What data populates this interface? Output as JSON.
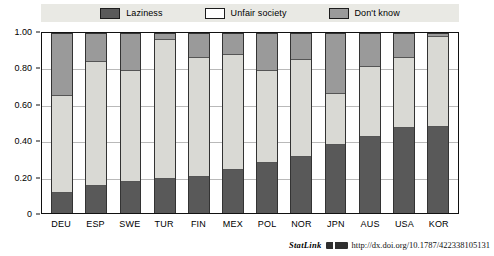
{
  "legend": {
    "items": [
      {
        "label": "Laziness",
        "color": "#595959",
        "icon": "legend-swatch-laziness"
      },
      {
        "label": "Unfair society",
        "color": "#ffffff",
        "icon": "legend-swatch-unfair-society"
      },
      {
        "label": "Don't know",
        "color": "#9a9a9a",
        "icon": "legend-swatch-dont-know"
      }
    ],
    "background": "#e9e9e4"
  },
  "axis": {
    "y_ticks": [
      "1.00",
      "0.80",
      "0.60",
      "0.40",
      "0.20",
      "0"
    ],
    "y_tick_values": [
      1.0,
      0.8,
      0.6,
      0.4,
      0.2,
      0
    ]
  },
  "footer": {
    "statlink_label": "StatLink",
    "url": "http://dx.doi.org/10.1787/422338105131",
    "glyph": "statlink-glyph-icon"
  },
  "chart_data": {
    "type": "bar",
    "subtype": "stacked-bar",
    "title": "",
    "subtitle": "",
    "xlabel": "",
    "ylabel": "",
    "ylim": [
      0,
      1.0
    ],
    "ytick_step": 0.2,
    "grid": true,
    "legend_position": "top-center",
    "categories": [
      "DEU",
      "ESP",
      "SWE",
      "TUR",
      "FIN",
      "MEX",
      "POL",
      "NOR",
      "JPN",
      "AUS",
      "USA",
      "KOR"
    ],
    "series": [
      {
        "name": "Laziness",
        "color": "#595959",
        "values": [
          0.11,
          0.15,
          0.17,
          0.19,
          0.2,
          0.24,
          0.28,
          0.31,
          0.38,
          0.42,
          0.47,
          0.48
        ]
      },
      {
        "name": "Unfair society",
        "color": "#d9d9d4",
        "values": [
          0.54,
          0.69,
          0.62,
          0.77,
          0.66,
          0.64,
          0.51,
          0.54,
          0.28,
          0.39,
          0.39,
          0.5
        ]
      },
      {
        "name": "Don't know",
        "color": "#9a9a9a",
        "values": [
          0.35,
          0.16,
          0.21,
          0.04,
          0.14,
          0.12,
          0.21,
          0.15,
          0.34,
          0.19,
          0.14,
          0.02
        ]
      }
    ],
    "cumulative_tops": {
      "laziness": [
        0.11,
        0.15,
        0.17,
        0.19,
        0.2,
        0.24,
        0.28,
        0.31,
        0.38,
        0.42,
        0.47,
        0.48
      ],
      "plus_unfair": [
        0.65,
        0.84,
        0.79,
        0.96,
        0.86,
        0.88,
        0.79,
        0.85,
        0.66,
        0.81,
        0.86,
        0.98
      ]
    }
  }
}
